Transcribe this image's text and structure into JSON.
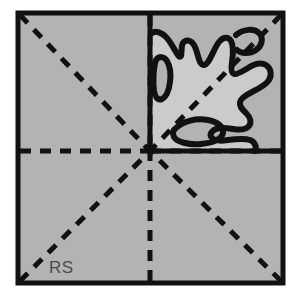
{
  "figure": {
    "label": "RS",
    "colors": {
      "page_background": "#ffffff",
      "square_fill": "#b3b3b3",
      "region_fill": "#cccccc",
      "line_color": "#111111",
      "label_color": "#4a4a4a"
    },
    "square": {
      "name": "outer-square",
      "x": 18,
      "y": 13,
      "width": 265,
      "height": 270,
      "stroke_width": 5
    },
    "center_point": {
      "x": 150,
      "y": 151
    },
    "symmetry_lines": [
      {
        "name": "diagonal-top-left",
        "style": "dashed",
        "from": [
          18,
          13
        ],
        "to": [
          150,
          151
        ]
      },
      {
        "name": "diagonal-top-right",
        "style": "dashed",
        "from": [
          283,
          13
        ],
        "to": [
          150,
          151
        ]
      },
      {
        "name": "diagonal-bottom-left",
        "style": "dashed",
        "from": [
          18,
          283
        ],
        "to": [
          150,
          151
        ]
      },
      {
        "name": "diagonal-bottom-right",
        "style": "dashed",
        "from": [
          283,
          283
        ],
        "to": [
          150,
          151
        ]
      },
      {
        "name": "axis-vertical-up",
        "style": "dashed",
        "from": [
          150,
          13
        ],
        "to": [
          150,
          151
        ]
      },
      {
        "name": "axis-vertical-down",
        "style": "dashed",
        "from": [
          150,
          283
        ],
        "to": [
          150,
          151
        ]
      },
      {
        "name": "axis-horizontal-left",
        "style": "dashed",
        "from": [
          18,
          151
        ],
        "to": [
          150,
          151
        ]
      },
      {
        "name": "axis-horizontal-right",
        "style": "dashed",
        "from": [
          283,
          151
        ],
        "to": [
          150,
          151
        ]
      }
    ],
    "quadrant_boundary": {
      "name": "upper-right-quadrant-outline",
      "style": "solid",
      "vertical_from": [
        150,
        13
      ],
      "vertical_to": [
        150,
        151
      ],
      "horizontal_from": [
        150,
        151
      ],
      "horizontal_to": [
        283,
        151
      ]
    },
    "region": {
      "name": "irregular-blob-region",
      "style": "solid-outline-filled",
      "stroke_width": 6,
      "description": "Irregular amoeba-like closed curve occupying the upper-right quadrant of the square"
    }
  }
}
